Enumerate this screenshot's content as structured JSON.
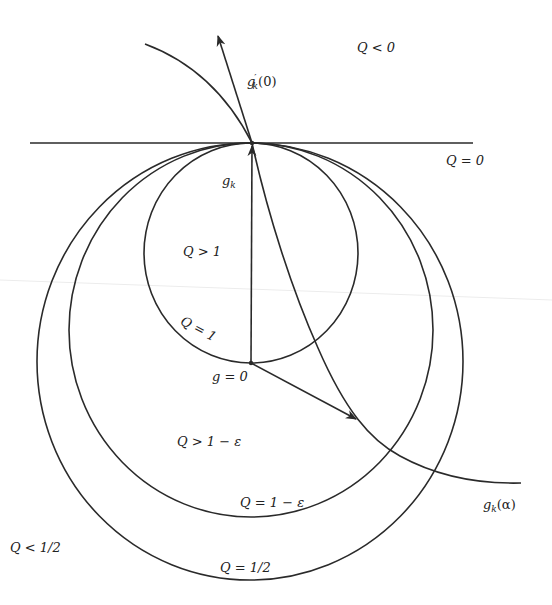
{
  "figure": {
    "colors": {
      "ink": "#2a2a2a",
      "background": "#ffffff"
    },
    "labels": {
      "q_less_0": "Q < 0",
      "q_eq_0": "Q = 0",
      "gk_prime_base": "g",
      "gk_prime_mark": "′",
      "gk_prime_sub": "k",
      "gk_prime_arg": "(0)",
      "gk_base": "g",
      "gk_sub": "k",
      "q_gt_1": "Q > 1",
      "q_eq_1": "Q = 1",
      "g_eq_0": "g = 0",
      "q_gt_1_minus_eps": "Q > 1 − ε",
      "q_eq_1_minus_eps": "Q = 1 − ε",
      "gk_alpha_base": "g",
      "gk_alpha_sub": "k",
      "gk_alpha_arg": "(α)",
      "q_less_half": "Q < 1/2",
      "q_eq_half": "Q = 1/2"
    },
    "elements": {
      "tangent_line": {
        "label": "Q = 0",
        "x1": 30,
        "y1": 143,
        "x2": 473,
        "y2": 143
      },
      "tangent_point": {
        "name": "g_k",
        "x": 252,
        "y": 143
      },
      "origin_point": {
        "name": "g = 0",
        "x": 251,
        "y": 363
      },
      "circles": [
        {
          "level": "Q = 1",
          "cx": 251,
          "cy": 253,
          "rx": 107,
          "ry": 110
        },
        {
          "level": "Q = 1 − ε",
          "cx": 251,
          "cy": 330,
          "rx": 182,
          "ry": 187
        },
        {
          "level": "Q = 1/2",
          "cx": 250,
          "cy": 361,
          "rx": 213,
          "ry": 218
        }
      ],
      "arrows": [
        {
          "name": "g_k vector",
          "from": [
            251,
            363
          ],
          "to": [
            252,
            145
          ]
        },
        {
          "name": "g'_k(0) direction",
          "from": [
            252,
            143
          ],
          "to": [
            218,
            35
          ]
        },
        {
          "name": "vector to g_k(alpha)",
          "from": [
            251,
            363
          ],
          "to": [
            355,
            419
          ]
        }
      ],
      "paths": [
        {
          "name": "Q=0 boundary curve (upper left)",
          "points": [
            [
              145,
              44
            ],
            [
              252,
              143
            ]
          ]
        },
        {
          "name": "g_k(alpha)",
          "points": [
            [
              252,
              143
            ],
            [
              313,
              340
            ],
            [
              357,
              418
            ],
            [
              389,
              449
            ],
            [
              433,
              471
            ],
            [
              521,
              483
            ]
          ]
        }
      ]
    }
  }
}
